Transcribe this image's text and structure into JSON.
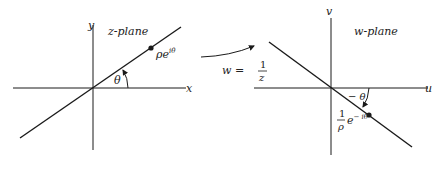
{
  "diagram": {
    "colors": {
      "ink": "#1a1a1a",
      "background": "#ffffff"
    },
    "z_plane": {
      "title": "z-plane",
      "x_axis_label": "x",
      "y_axis_label": "y",
      "point_label": "ρe",
      "point_label_sup": "iθ",
      "angle_label": "θ"
    },
    "mapping": {
      "label_lhs": "w =",
      "label_num": "1",
      "label_den": "z"
    },
    "w_plane": {
      "title": "w-plane",
      "u_axis_label": "u",
      "v_axis_label": "v",
      "point_label_num": "1",
      "point_label_den": "ρ",
      "point_label_base": "e",
      "point_label_sup": "− iθ",
      "angle_label": "− θ"
    }
  }
}
